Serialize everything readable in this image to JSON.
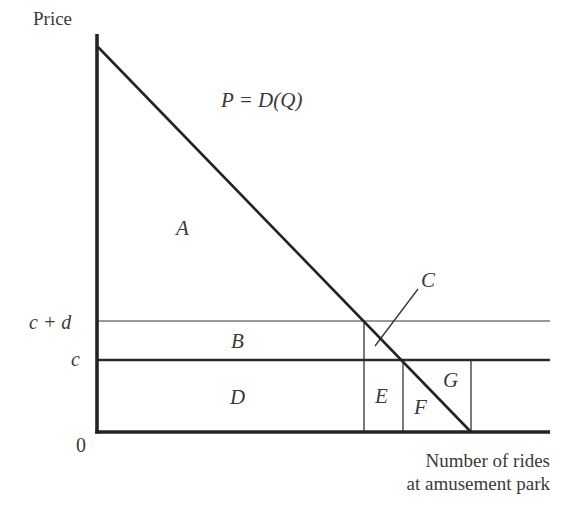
{
  "diagram": {
    "type": "economics-surplus-diagram",
    "axes": {
      "y_label": "Price",
      "x_label_line1": "Number of rides",
      "x_label_line2": "at amusement park",
      "origin_label": "0"
    },
    "price_ticks": {
      "upper": "c + d",
      "lower": "c"
    },
    "demand_curve": {
      "label": "P = D(Q)",
      "color": "#222222"
    },
    "regions": {
      "A": "A",
      "B": "B",
      "C": "C",
      "D": "D",
      "E": "E",
      "F": "F",
      "G": "G"
    },
    "colors": {
      "axis": "#222222",
      "price_line_c": "#2a2a2a",
      "price_line_cd": "#9a9a9a",
      "guide_lines": "#333333",
      "text": "#3a3a3a"
    }
  }
}
